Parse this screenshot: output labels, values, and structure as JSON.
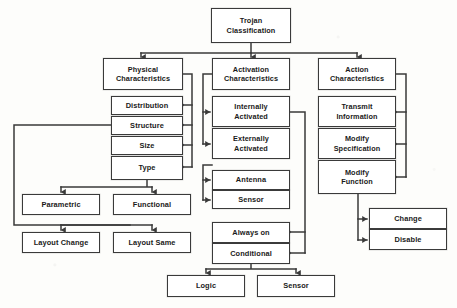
{
  "diagram": {
    "title": "Trojan Classification",
    "type": "hierarchical-block-diagram",
    "line_color": "#3a3a3a",
    "box_fill": "#ffffff",
    "nodes": [
      {
        "id": "root",
        "label": "Trojan\nClassification",
        "x": 211,
        "y": 8,
        "w": 80,
        "h": 35
      },
      {
        "id": "physical",
        "label": "Physical\nCharacteristics",
        "x": 103,
        "y": 58,
        "w": 80,
        "h": 32
      },
      {
        "id": "distribution",
        "label": "Distribution",
        "x": 111,
        "y": 96,
        "w": 72,
        "h": 19
      },
      {
        "id": "structure",
        "label": "Structure",
        "x": 111,
        "y": 116,
        "w": 72,
        "h": 19
      },
      {
        "id": "size",
        "label": "Size",
        "x": 111,
        "y": 136,
        "w": 72,
        "h": 19
      },
      {
        "id": "type",
        "label": "Type",
        "x": 111,
        "y": 156,
        "w": 72,
        "h": 24
      },
      {
        "id": "parametric",
        "label": "Parametric",
        "x": 22,
        "y": 194,
        "w": 78,
        "h": 21
      },
      {
        "id": "functional",
        "label": "Functional",
        "x": 113,
        "y": 194,
        "w": 78,
        "h": 21
      },
      {
        "id": "layoutchange",
        "label": "Layout Change",
        "x": 22,
        "y": 232,
        "w": 78,
        "h": 21
      },
      {
        "id": "layoutsame",
        "label": "Layout Same",
        "x": 113,
        "y": 232,
        "w": 78,
        "h": 21
      },
      {
        "id": "activation",
        "label": "Activation\nCharacteristics",
        "x": 212,
        "y": 58,
        "w": 78,
        "h": 32
      },
      {
        "id": "internally",
        "label": "Internally\nActivated",
        "x": 212,
        "y": 96,
        "w": 78,
        "h": 31
      },
      {
        "id": "externally",
        "label": "Externally\nActivated",
        "x": 212,
        "y": 128,
        "w": 78,
        "h": 31
      },
      {
        "id": "antenna",
        "label": "Antenna",
        "x": 212,
        "y": 170,
        "w": 78,
        "h": 20
      },
      {
        "id": "sensor1",
        "label": "Sensor",
        "x": 212,
        "y": 190,
        "w": 78,
        "h": 19
      },
      {
        "id": "alwayson",
        "label": "Always on",
        "x": 212,
        "y": 222,
        "w": 78,
        "h": 21
      },
      {
        "id": "conditional",
        "label": "Conditional",
        "x": 212,
        "y": 243,
        "w": 78,
        "h": 21
      },
      {
        "id": "logic",
        "label": "Logic",
        "x": 167,
        "y": 275,
        "w": 78,
        "h": 22
      },
      {
        "id": "sensor2",
        "label": "Sensor",
        "x": 257,
        "y": 275,
        "w": 78,
        "h": 22
      },
      {
        "id": "action",
        "label": "Action\nCharacteristics",
        "x": 318,
        "y": 58,
        "w": 78,
        "h": 32
      },
      {
        "id": "transmit",
        "label": "Transmit\nInformation",
        "x": 318,
        "y": 96,
        "w": 78,
        "h": 31
      },
      {
        "id": "modifyspec",
        "label": "Modify\nSpecification",
        "x": 318,
        "y": 128,
        "w": 78,
        "h": 31
      },
      {
        "id": "modifyfunc",
        "label": "Modify\nFunction",
        "x": 318,
        "y": 160,
        "w": 78,
        "h": 34
      },
      {
        "id": "change",
        "label": "Change",
        "x": 369,
        "y": 208,
        "w": 78,
        "h": 21
      },
      {
        "id": "disable",
        "label": "Disable",
        "x": 369,
        "y": 229,
        "w": 78,
        "h": 21
      }
    ],
    "edges": [
      {
        "from": "root",
        "to": "physical"
      },
      {
        "from": "root",
        "to": "activation"
      },
      {
        "from": "root",
        "to": "action"
      },
      {
        "from": "physical",
        "to": "distribution"
      },
      {
        "from": "physical",
        "to": "structure"
      },
      {
        "from": "physical",
        "to": "size"
      },
      {
        "from": "physical",
        "to": "type"
      },
      {
        "from": "type",
        "to": "parametric"
      },
      {
        "from": "type",
        "to": "functional"
      },
      {
        "from": "structure",
        "to": "layoutchange"
      },
      {
        "from": "structure",
        "to": "layoutsame"
      },
      {
        "from": "activation",
        "to": "internally"
      },
      {
        "from": "activation",
        "to": "externally"
      },
      {
        "from": "activation",
        "to": "antenna"
      },
      {
        "from": "activation",
        "to": "sensor1"
      },
      {
        "from": "internally",
        "to": "alwayson"
      },
      {
        "from": "internally",
        "to": "conditional"
      },
      {
        "from": "conditional",
        "to": "logic"
      },
      {
        "from": "conditional",
        "to": "sensor2"
      },
      {
        "from": "action",
        "to": "transmit"
      },
      {
        "from": "action",
        "to": "modifyspec"
      },
      {
        "from": "action",
        "to": "modifyfunc"
      },
      {
        "from": "modifyfunc",
        "to": "change"
      },
      {
        "from": "modifyfunc",
        "to": "disable"
      }
    ]
  }
}
